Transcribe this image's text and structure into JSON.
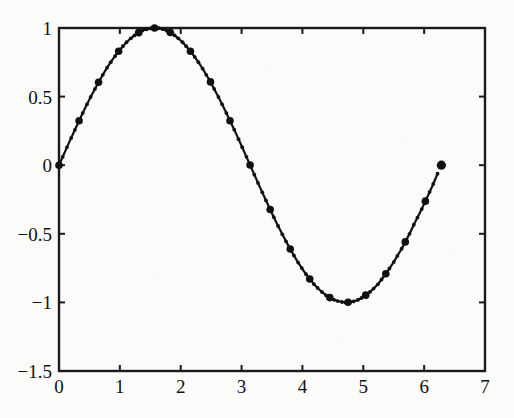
{
  "chart_data": {
    "type": "line",
    "title": "",
    "subtitle": "",
    "xlabel": "",
    "ylabel": "",
    "xlim": [
      0,
      7
    ],
    "ylim": [
      -1.5,
      1
    ],
    "grid": false,
    "legend": null,
    "legend_position": "none",
    "series": [
      {
        "name": "sin(x)",
        "marker": "filled-circle",
        "marker_color": "#111111",
        "line_color": "#111111",
        "note": "adaptively sampled sine curve, dense markers where curvature is high",
        "x": [
          0.0,
          0.06,
          0.13,
          0.2,
          0.26,
          0.33,
          0.39,
          0.46,
          0.52,
          0.59,
          0.65,
          0.72,
          0.79,
          0.85,
          0.92,
          0.98,
          1.05,
          1.11,
          1.18,
          1.24,
          1.31,
          1.37,
          1.44,
          1.5,
          1.54,
          1.57,
          1.6,
          1.64,
          1.7,
          1.77,
          1.83,
          1.9,
          1.96,
          2.03,
          2.09,
          2.16,
          2.23,
          2.29,
          2.36,
          2.42,
          2.49,
          2.55,
          2.62,
          2.68,
          2.75,
          2.81,
          2.88,
          2.95,
          3.01,
          3.08,
          3.14,
          3.21,
          3.27,
          3.34,
          3.4,
          3.47,
          3.53,
          3.6,
          3.67,
          3.73,
          3.8,
          3.86,
          3.93,
          3.99,
          4.06,
          4.12,
          4.19,
          4.25,
          4.32,
          4.39,
          4.45,
          4.52,
          4.58,
          4.65,
          4.71,
          4.75,
          4.78,
          4.84,
          4.91,
          4.97,
          5.04,
          5.11,
          5.17,
          5.24,
          5.3,
          5.37,
          5.43,
          5.5,
          5.56,
          5.63,
          5.69,
          5.76,
          5.83,
          5.89,
          5.96,
          6.02,
          6.09,
          6.15,
          6.22,
          6.283
        ],
        "y": [
          0.0,
          0.06,
          0.13,
          0.199,
          0.257,
          0.324,
          0.38,
          0.444,
          0.497,
          0.556,
          0.605,
          0.659,
          0.711,
          0.751,
          0.795,
          0.83,
          0.867,
          0.896,
          0.925,
          0.946,
          0.966,
          0.981,
          0.991,
          0.997,
          0.9995,
          1.0,
          0.9995,
          0.998,
          0.992,
          0.98,
          0.967,
          0.946,
          0.925,
          0.896,
          0.867,
          0.83,
          0.789,
          0.751,
          0.704,
          0.659,
          0.607,
          0.556,
          0.497,
          0.444,
          0.38,
          0.324,
          0.259,
          0.19,
          0.131,
          0.061,
          0.0016,
          -0.069,
          -0.129,
          -0.198,
          -0.256,
          -0.323,
          -0.379,
          -0.443,
          -0.504,
          -0.555,
          -0.611,
          -0.658,
          -0.71,
          -0.75,
          -0.795,
          -0.829,
          -0.867,
          -0.895,
          -0.924,
          -0.949,
          -0.965,
          -0.981,
          -0.99,
          -0.997,
          -1.0,
          -0.9993,
          -0.9968,
          -0.993,
          -0.982,
          -0.968,
          -0.947,
          -0.924,
          -0.899,
          -0.868,
          -0.833,
          -0.791,
          -0.753,
          -0.706,
          -0.661,
          -0.609,
          -0.559,
          -0.5,
          -0.434,
          -0.382,
          -0.32,
          -0.262,
          -0.195,
          -0.137,
          -0.062,
          0.0
        ]
      }
    ],
    "xticks": [
      0,
      1,
      2,
      3,
      4,
      5,
      6,
      7
    ],
    "xtick_labels": [
      "0",
      "1",
      "2",
      "3",
      "4",
      "5",
      "6",
      "7"
    ],
    "yticks": [
      1,
      0.5,
      0,
      -0.5,
      -1,
      -1.5
    ],
    "ytick_labels": [
      "1",
      "0.5",
      "0",
      "−0.5",
      "−1",
      "−1.5"
    ],
    "axis_color": "#1a1a1a",
    "background_color": "#fbfbf9"
  },
  "figure": {
    "frame_label": "plot-box",
    "emphasized_markers_note": "large filled dots at selected sample points, isolated large dot at the right end (6.283, 0)"
  }
}
